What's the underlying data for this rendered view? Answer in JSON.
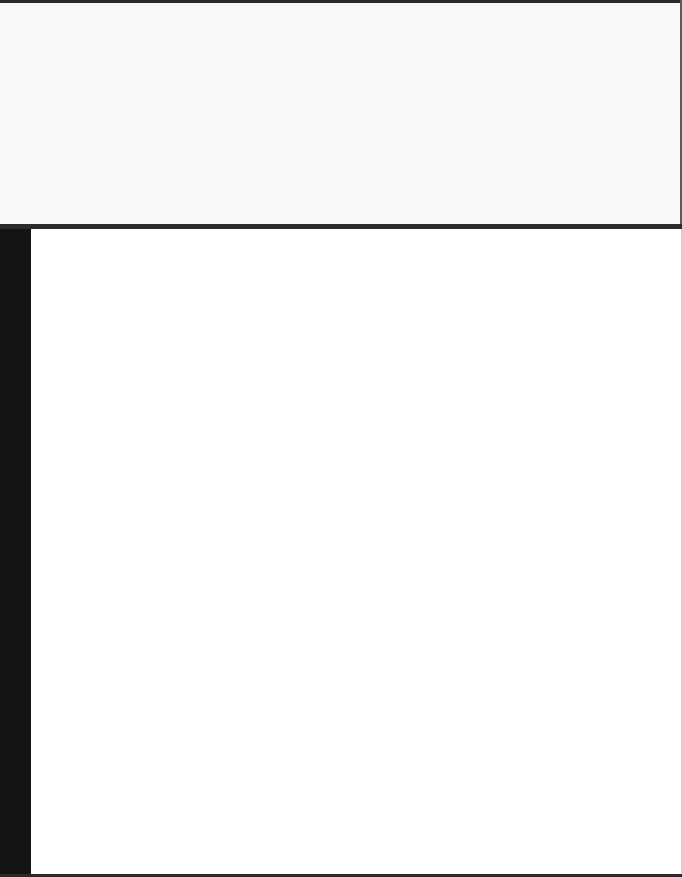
{
  "page": {
    "content": "",
    "colors": {
      "background": "#ffffff",
      "top_panel": "#f8f8f8",
      "divider": "#2b2b2b",
      "left_bar": "#141414"
    }
  }
}
